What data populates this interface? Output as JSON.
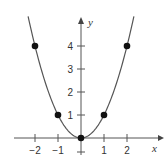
{
  "chart_data": {
    "type": "line",
    "title": "",
    "function": "y = x^2",
    "xlabel": "x",
    "ylabel": "y",
    "xlim": [
      -2.3,
      2.3
    ],
    "ylim": [
      0,
      5.4
    ],
    "grid": false,
    "x_ticks": [
      -2,
      -1,
      1,
      2
    ],
    "x_tick_labels": [
      "−2",
      "−1",
      "1",
      "2"
    ],
    "y_ticks": [
      1,
      2,
      3,
      4
    ],
    "y_tick_labels": [
      "1",
      "2",
      "3",
      "4"
    ],
    "points": [
      {
        "x": -2,
        "y": 4
      },
      {
        "x": -1,
        "y": 1
      },
      {
        "x": 0,
        "y": 0
      },
      {
        "x": 1,
        "y": 1
      },
      {
        "x": 2,
        "y": 4
      }
    ],
    "colors": {
      "curve": "#555555",
      "points": "#111111",
      "axes": "#555555"
    }
  }
}
